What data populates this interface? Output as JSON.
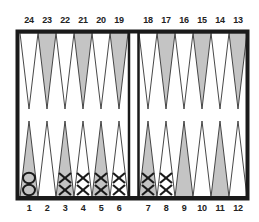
{
  "board": {
    "colors": {
      "border": "#1a1a1a",
      "light_point": "#ffffff",
      "dark_point": "#c4c4c4",
      "background": "#ffffff"
    },
    "top_numbers_left": [
      "24",
      "23",
      "22",
      "21",
      "20",
      "19"
    ],
    "top_numbers_right": [
      "18",
      "17",
      "16",
      "15",
      "14",
      "13"
    ],
    "bottom_numbers_left": [
      "1",
      "2",
      "3",
      "4",
      "5",
      "6"
    ],
    "bottom_numbers_right": [
      "7",
      "8",
      "9",
      "10",
      "11",
      "12"
    ],
    "checkers": [
      {
        "point": 1,
        "symbol": "O",
        "count": 2
      },
      {
        "point": 3,
        "symbol": "X",
        "count": 2
      },
      {
        "point": 4,
        "symbol": "X",
        "count": 2
      },
      {
        "point": 5,
        "symbol": "X",
        "count": 2
      },
      {
        "point": 6,
        "symbol": "X",
        "count": 2
      },
      {
        "point": 7,
        "symbol": "X",
        "count": 2
      },
      {
        "point": 8,
        "symbol": "X",
        "count": 2
      }
    ]
  }
}
